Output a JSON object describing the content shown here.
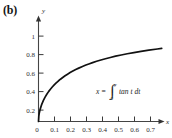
{
  "figure": {
    "panel_label": "(b)"
  },
  "chart_data": {
    "type": "line",
    "title": "",
    "subtitle": "",
    "xlabel": "x",
    "ylabel": "y",
    "xlim": [
      0,
      0.78
    ],
    "ylim": [
      0,
      1.12
    ],
    "grid": false,
    "legend": null,
    "annotations": [
      {
        "name": "integral-equation",
        "parts": {
          "lhs": "x",
          "equals": "=",
          "integral_sign": "∫",
          "lower_limit": "0",
          "upper_limit": "y",
          "integrand": "tan t dt"
        },
        "plain_text": "x = ∫₀ʸ tan t dt",
        "x": 0.33,
        "y": 0.4
      }
    ],
    "x_ticks": [
      0,
      0.1,
      0.2,
      0.3,
      0.4,
      0.5,
      0.6,
      0.7
    ],
    "x_tick_labels": [
      "0",
      "0.1",
      "0.2",
      "0.3",
      "0.4",
      "0.5",
      "0.6",
      "0.7"
    ],
    "y_ticks": [
      0.2,
      0.4,
      0.6,
      0.8,
      1
    ],
    "y_tick_labels": [
      "0.2",
      "0.4",
      "0.6",
      "0.8",
      "1"
    ],
    "origin_label": "0",
    "series": [
      {
        "name": "y as function of x where x = integral of tan t dt",
        "color": "#111111",
        "x": [
          0.0,
          0.002,
          0.005,
          0.0101,
          0.0203,
          0.0306,
          0.0411,
          0.0519,
          0.0629,
          0.0743,
          0.086,
          0.0981,
          0.1107,
          0.1237,
          0.1373,
          0.1514,
          0.1661,
          0.1816,
          0.1977,
          0.2147,
          0.2326,
          0.2514,
          0.2713,
          0.2923,
          0.3145,
          0.3381,
          0.3632,
          0.3899,
          0.4184,
          0.4489,
          0.4817,
          0.5169,
          0.5549,
          0.5961,
          0.6408,
          0.6895,
          0.7428,
          0.77
        ],
        "y": [
          0.0,
          0.0632,
          0.1,
          0.1419,
          0.2013,
          0.2469,
          0.2853,
          0.3191,
          0.3497,
          0.3778,
          0.404,
          0.4286,
          0.4519,
          0.474,
          0.4952,
          0.5156,
          0.5352,
          0.5542,
          0.5726,
          0.5905,
          0.608,
          0.625,
          0.6417,
          0.658,
          0.674,
          0.6897,
          0.7051,
          0.7203,
          0.7353,
          0.75,
          0.7646,
          0.779,
          0.7933,
          0.8074,
          0.8214,
          0.8353,
          0.849,
          0.857
        ]
      }
    ]
  }
}
